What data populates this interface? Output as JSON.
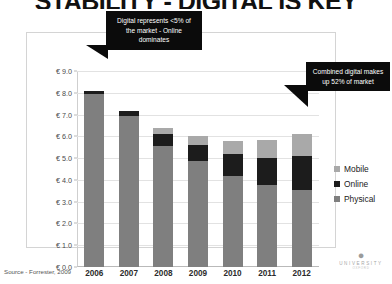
{
  "slide": {
    "title": "STABILITY - DIGITAL IS KEY",
    "source": "Source - Forrester, 2009"
  },
  "callouts": [
    {
      "id": "left",
      "text": "Digital represents <5% of the market - Online dominates"
    },
    {
      "id": "right",
      "text": "Combined digital makes up 52% of market"
    }
  ],
  "legend": {
    "items": [
      {
        "label": "Mobile",
        "color": "#a9a9a9"
      },
      {
        "label": "Online",
        "color": "#1c1c1c"
      },
      {
        "label": "Physical",
        "color": "#7f7f7f"
      }
    ]
  },
  "logo": {
    "line1": "UNIVERSITY",
    "line2": "OXFORD"
  },
  "chart_data": {
    "type": "bar",
    "stacked": true,
    "title": "",
    "xlabel": "",
    "ylabel": "",
    "categories": [
      "2006",
      "2007",
      "2008",
      "2009",
      "2010",
      "2011",
      "2012"
    ],
    "series": [
      {
        "name": "Physical",
        "color": "#7f7f7f",
        "values": [
          7.95,
          6.95,
          5.55,
          4.85,
          4.2,
          3.75,
          3.55
        ]
      },
      {
        "name": "Online",
        "color": "#1c1c1c",
        "values": [
          0.15,
          0.2,
          0.55,
          0.75,
          1.0,
          1.25,
          1.55
        ]
      },
      {
        "name": "Mobile",
        "color": "#a9a9a9",
        "values": [
          0.0,
          0.0,
          0.3,
          0.4,
          0.6,
          0.85,
          1.0
        ]
      }
    ],
    "totals": [
      8.1,
      7.15,
      6.4,
      6.0,
      5.8,
      5.85,
      6.1
    ],
    "ylim": [
      0,
      9
    ],
    "ytick_step": 1,
    "ytick_labels": [
      "€ 9.0",
      "€ 8.0",
      "€ 7.0",
      "€ 6.0",
      "€ 5.0",
      "€ 4.0",
      "€ 3.0",
      "€ 2.0",
      "€ 1.0",
      "€ 0.0"
    ],
    "ytick_values": [
      9,
      8,
      7,
      6,
      5,
      4,
      3,
      2,
      1,
      0
    ],
    "grid": true,
    "legend_position": "right"
  }
}
